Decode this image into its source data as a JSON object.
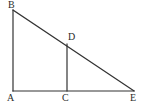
{
  "figure": {
    "type": "geometry-diagram",
    "width": 143,
    "height": 105,
    "background_color": "#ffffff",
    "stroke_color": "#333333",
    "label_color": "#2b2b2b",
    "stroke_width": 1.2,
    "points": {
      "A": {
        "label": "A",
        "x": 13,
        "y": 91,
        "label_x": 7,
        "label_y": 93
      },
      "B": {
        "label": "B",
        "x": 13,
        "y": 10,
        "label_x": 8,
        "label_y": 0
      },
      "C": {
        "label": "C",
        "x": 67,
        "y": 91,
        "label_x": 62,
        "label_y": 93
      },
      "D": {
        "label": "D",
        "x": 67,
        "y": 44,
        "label_x": 68,
        "label_y": 32
      },
      "E": {
        "label": "E",
        "x": 134,
        "y": 91,
        "label_x": 130,
        "label_y": 93
      }
    },
    "segments": [
      {
        "name": "AB",
        "from": "A",
        "to": "B",
        "role": "left-vertical-leg"
      },
      {
        "name": "AE",
        "from": "A",
        "to": "E",
        "role": "base-horizontal-leg"
      },
      {
        "name": "BE",
        "from": "B",
        "to": "E",
        "role": "hypotenuse"
      },
      {
        "name": "CD",
        "from": "C",
        "to": "D",
        "role": "inner-vertical-segment"
      }
    ]
  }
}
